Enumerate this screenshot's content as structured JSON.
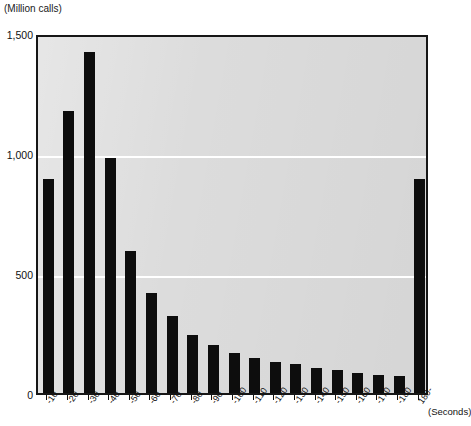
{
  "chart_data": {
    "type": "bar",
    "title": "",
    "subtitle": "",
    "ylabel": "(Million calls)",
    "xlabel": "(Seconds)",
    "ylim": [
      0,
      1500
    ],
    "yticks": [
      0,
      500,
      1000,
      1500
    ],
    "ytick_labels": [
      "0",
      "500",
      "1,000",
      "1,500"
    ],
    "grid": "horizontal-white",
    "legend": "none",
    "bar_color": "#0d0d0d",
    "plot_background": "#dcdcdc",
    "categories": [
      "-10",
      "-20",
      "-30",
      "-40",
      "-50",
      "-60",
      "-70",
      "-80",
      "-90",
      "-100",
      "-110",
      "-120",
      "-130",
      "-140",
      "-150",
      "-160",
      "-170",
      "-180",
      "180-"
    ],
    "values": [
      890,
      1175,
      1420,
      980,
      590,
      415,
      320,
      240,
      200,
      165,
      145,
      130,
      120,
      105,
      95,
      85,
      75,
      70,
      890
    ],
    "series": [
      {
        "name": "Million calls",
        "values": [
          890,
          1175,
          1420,
          980,
          590,
          415,
          320,
          240,
          200,
          165,
          145,
          130,
          120,
          105,
          95,
          85,
          75,
          70,
          890
        ]
      }
    ]
  },
  "labels": {
    "unit_top": "(Million calls)",
    "unit_right": "(Seconds)"
  }
}
